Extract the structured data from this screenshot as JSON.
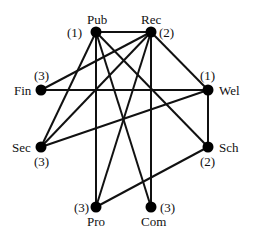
{
  "nodes": [
    {
      "id": "Pub",
      "label": "Pub",
      "degree_label": "(1)",
      "x": 96,
      "y": 32
    },
    {
      "id": "Rec",
      "label": "Rec",
      "degree_label": "(2)",
      "x": 151,
      "y": 32
    },
    {
      "id": "Fin",
      "label": "Fin",
      "degree_label": "(3)",
      "x": 41,
      "y": 90
    },
    {
      "id": "Wel",
      "label": "Wel",
      "degree_label": "(1)",
      "x": 208,
      "y": 90
    },
    {
      "id": "Sec",
      "label": "Sec",
      "degree_label": "(3)",
      "x": 41,
      "y": 147
    },
    {
      "id": "Sch",
      "label": "Sch",
      "degree_label": "(2)",
      "x": 208,
      "y": 147
    },
    {
      "id": "Pro",
      "label": "Pro",
      "degree_label": "(3)",
      "x": 96,
      "y": 207
    },
    {
      "id": "Com",
      "label": "Com",
      "degree_label": "(3)",
      "x": 151,
      "y": 207
    }
  ],
  "edges": [
    [
      "Pub",
      "Rec"
    ],
    [
      "Pub",
      "Sec"
    ],
    [
      "Pub",
      "Pro"
    ],
    [
      "Pub",
      "Com"
    ],
    [
      "Pub",
      "Sch"
    ],
    [
      "Rec",
      "Fin"
    ],
    [
      "Rec",
      "Sec"
    ],
    [
      "Rec",
      "Pro"
    ],
    [
      "Rec",
      "Com"
    ],
    [
      "Rec",
      "Wel"
    ],
    [
      "Fin",
      "Wel"
    ],
    [
      "Sec",
      "Wel"
    ],
    [
      "Wel",
      "Sch"
    ],
    [
      "Sch",
      "Pro"
    ]
  ]
}
